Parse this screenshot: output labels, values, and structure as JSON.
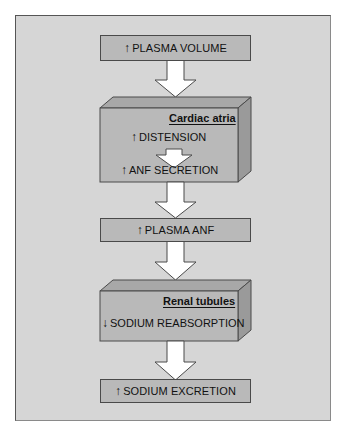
{
  "colors": {
    "panel_bg": "#d6d6d6",
    "box_fill": "#b9b9b9",
    "box_top": "#a8a8a8",
    "box_side": "#9a9a9a",
    "arrow_fill": "#ffffff",
    "outline": "#4a4a4a"
  },
  "icons": {
    "up": "↑",
    "down": "↓"
  },
  "flow": {
    "step1": {
      "direction": "↑",
      "label": "PLASMA VOLUME"
    },
    "atria": {
      "title": "Cardiac atria",
      "line1": {
        "direction": "↑",
        "label": "DISTENSION"
      },
      "line2": {
        "direction": "↑",
        "label": "ANF SECRETION"
      }
    },
    "step3": {
      "direction": "↑",
      "label": "PLASMA ANF"
    },
    "renal": {
      "title": "Renal tubules",
      "line1": {
        "direction": "↓",
        "label": "SODIUM REABSORPTION"
      }
    },
    "step5": {
      "direction": "↑",
      "label": "SODIUM EXCRETION"
    }
  }
}
